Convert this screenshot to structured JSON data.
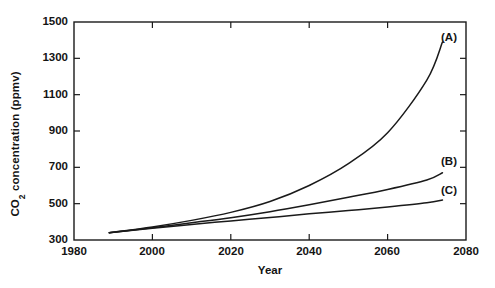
{
  "chart_data": {
    "type": "line",
    "title": "",
    "xlabel": "Year",
    "ylabel_text": "CO",
    "ylabel_sub": "2",
    "ylabel_rest": " concentration (ppmv)",
    "ylabel_full": "CO2 concentration (ppmv)",
    "xlim": [
      1980,
      2080
    ],
    "ylim": [
      300,
      1500
    ],
    "xticks": [
      1980,
      2000,
      2020,
      2040,
      2060,
      2080
    ],
    "xtick_labels": [
      "1980",
      "2000",
      "2020",
      "2040",
      "2060",
      "2080"
    ],
    "yticks": [
      300,
      500,
      700,
      900,
      1100,
      1300,
      1500
    ],
    "ytick_labels": [
      "300",
      "500",
      "700",
      "900",
      "1100",
      "1300",
      "1500"
    ],
    "grid": false,
    "legend_position": "inline-right-end-labels",
    "x": [
      1989,
      2000,
      2010,
      2020,
      2030,
      2040,
      2050,
      2060,
      2070,
      2074
    ],
    "series": [
      {
        "name": "(A)",
        "label": "(A)",
        "color": "#1a1a1a",
        "values": [
          340,
          372,
          408,
          452,
          512,
          600,
          720,
          890,
          1180,
          1390
        ],
        "end_label_x": 2076,
        "end_label_y": 1400
      },
      {
        "name": "(B)",
        "label": "(B)",
        "color": "#1a1a1a",
        "values": [
          340,
          368,
          395,
          423,
          456,
          494,
          535,
          578,
          630,
          670
        ],
        "end_label_x": 2076,
        "end_label_y": 730
      },
      {
        "name": "(C)",
        "label": "(C)",
        "color": "#1a1a1a",
        "values": [
          340,
          364,
          386,
          405,
          424,
          444,
          462,
          482,
          505,
          520
        ],
        "end_label_x": 2076,
        "end_label_y": 570
      }
    ]
  },
  "axes": {
    "frame_color": "#1a1a1a",
    "tick_color": "#1a1a1a",
    "background": "#ffffff"
  }
}
